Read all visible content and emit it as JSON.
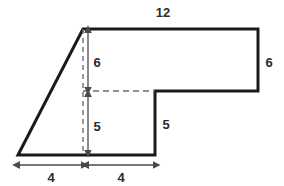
{
  "figure": {
    "name": "composite-polygon-with-dimensions",
    "background_color": "#ffffff",
    "outline_color": "#1a1a1a",
    "outline_width": 3,
    "guide_color": "#6e6e6e",
    "label_color": "#2b2b2b",
    "outline_points": "18,155 83,29 258,29 258,91 155,91 155,155",
    "guides": [
      {
        "name": "vertical-dashed-guide",
        "x1": 83,
        "y1": 29,
        "x2": 83,
        "y2": 155
      },
      {
        "name": "horizontal-dashed-guide",
        "x1": 83,
        "y1": 91,
        "x2": 155,
        "y2": 91
      }
    ],
    "dimensions": [
      {
        "id": "top-width",
        "label": "12",
        "orientation": "horizontal",
        "label_x": 163,
        "label_y": 17,
        "arrow": null
      },
      {
        "id": "upper-left-height",
        "label": "6",
        "orientation": "vertical",
        "label_x": 97,
        "label_y": 62,
        "arrow": {
          "x1": 88,
          "y1": 33,
          "x2": 88,
          "y2": 88
        }
      },
      {
        "id": "right-height",
        "label": "6",
        "orientation": "vertical",
        "label_x": 269,
        "label_y": 62,
        "arrow": null
      },
      {
        "id": "lower-left-height",
        "label": "5",
        "orientation": "vertical",
        "label_x": 97,
        "label_y": 126,
        "arrow": {
          "x1": 88,
          "y1": 97,
          "x2": 88,
          "y2": 151
        }
      },
      {
        "id": "notch-height",
        "label": "5",
        "orientation": "vertical",
        "label_x": 166,
        "label_y": 124,
        "arrow": null
      },
      {
        "id": "bottom-left-width",
        "label": "4",
        "orientation": "horizontal",
        "label_x": 51,
        "label_y": 178,
        "arrow": {
          "x1": 20,
          "y1": 165,
          "x2": 82,
          "y2": 165
        }
      },
      {
        "id": "bottom-right-width",
        "label": "4",
        "orientation": "horizontal",
        "label_x": 121,
        "label_y": 178,
        "arrow": {
          "x1": 89,
          "y1": 165,
          "x2": 154,
          "y2": 165
        }
      }
    ]
  }
}
